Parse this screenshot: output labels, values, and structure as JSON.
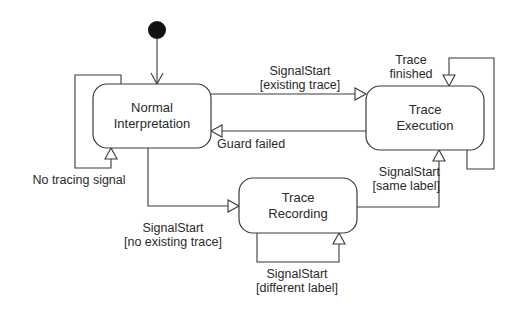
{
  "diagram": {
    "type": "uml-state-machine",
    "initial_state": {
      "target": "normal_interpretation"
    },
    "states": [
      {
        "id": "normal_interpretation",
        "label_lines": [
          "Normal",
          "Interpretation"
        ]
      },
      {
        "id": "trace_execution",
        "label_lines": [
          "Trace",
          "Execution"
        ]
      },
      {
        "id": "trace_recording",
        "label_lines": [
          "Trace",
          "Recording"
        ]
      }
    ],
    "transitions": [
      {
        "from": "normal_interpretation",
        "to": "normal_interpretation",
        "label_lines": [
          "No tracing signal"
        ]
      },
      {
        "from": "normal_interpretation",
        "to": "trace_execution",
        "label_lines": [
          "SignalStart",
          "[existing trace]"
        ]
      },
      {
        "from": "trace_execution",
        "to": "normal_interpretation",
        "label_lines": [
          "Guard failed"
        ]
      },
      {
        "from": "trace_execution",
        "to": "trace_execution",
        "label_lines": [
          "Trace",
          "finished"
        ]
      },
      {
        "from": "normal_interpretation",
        "to": "trace_recording",
        "label_lines": [
          "SignalStart",
          "[no existing trace]"
        ]
      },
      {
        "from": "trace_recording",
        "to": "trace_execution",
        "label_lines": [
          "SignalStart",
          "[same label]"
        ]
      },
      {
        "from": "trace_recording",
        "to": "trace_recording",
        "label_lines": [
          "SignalStart",
          "[different label]"
        ]
      }
    ]
  },
  "colors": {
    "line": "#3a3a3a",
    "text": "#2a2a2a",
    "background": "#ffffff",
    "initial_dot": "#111111"
  }
}
